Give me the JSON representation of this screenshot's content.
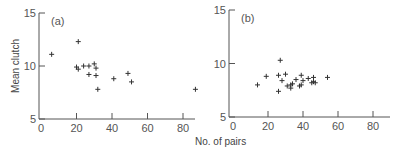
{
  "chart_data": [
    {
      "type": "scatter",
      "panel_label": "(a)",
      "xlabel": "No. of pairs",
      "ylabel": "Mean clutch",
      "xlim": [
        0,
        90
      ],
      "ylim": [
        5,
        15
      ],
      "x_ticks": [
        0,
        20,
        40,
        60,
        80
      ],
      "y_ticks": [
        5,
        10,
        15
      ],
      "grid": false,
      "marker": "+",
      "points": [
        {
          "x": 6,
          "y": 11.1
        },
        {
          "x": 21,
          "y": 12.3
        },
        {
          "x": 20,
          "y": 9.9
        },
        {
          "x": 21,
          "y": 9.7
        },
        {
          "x": 24,
          "y": 10.0
        },
        {
          "x": 27,
          "y": 10.0
        },
        {
          "x": 30,
          "y": 10.2
        },
        {
          "x": 31,
          "y": 9.8
        },
        {
          "x": 27,
          "y": 9.2
        },
        {
          "x": 31,
          "y": 9.1
        },
        {
          "x": 32,
          "y": 7.8
        },
        {
          "x": 41,
          "y": 8.8
        },
        {
          "x": 49,
          "y": 9.3
        },
        {
          "x": 51,
          "y": 8.5
        },
        {
          "x": 87,
          "y": 7.8
        }
      ]
    },
    {
      "type": "scatter",
      "panel_label": "(b)",
      "xlabel": "No. of pairs",
      "ylabel": "",
      "xlim": [
        0,
        90
      ],
      "ylim": [
        5,
        15
      ],
      "x_ticks": [
        0,
        20,
        40,
        60,
        80
      ],
      "y_ticks": [
        5,
        10,
        15
      ],
      "grid": false,
      "marker": "+",
      "points": [
        {
          "x": 14,
          "y": 8.0
        },
        {
          "x": 19,
          "y": 8.8
        },
        {
          "x": 26,
          "y": 8.9
        },
        {
          "x": 27,
          "y": 10.3
        },
        {
          "x": 28,
          "y": 8.4
        },
        {
          "x": 30,
          "y": 9.0
        },
        {
          "x": 26,
          "y": 7.4
        },
        {
          "x": 31,
          "y": 7.9
        },
        {
          "x": 33,
          "y": 8.0
        },
        {
          "x": 33,
          "y": 7.7
        },
        {
          "x": 34,
          "y": 8.1
        },
        {
          "x": 36,
          "y": 8.5
        },
        {
          "x": 38,
          "y": 7.9
        },
        {
          "x": 39,
          "y": 8.0
        },
        {
          "x": 39,
          "y": 8.9
        },
        {
          "x": 40,
          "y": 8.4
        },
        {
          "x": 43,
          "y": 8.6
        },
        {
          "x": 45,
          "y": 8.2
        },
        {
          "x": 46,
          "y": 8.7
        },
        {
          "x": 46,
          "y": 8.3
        },
        {
          "x": 47,
          "y": 8.2
        },
        {
          "x": 54,
          "y": 8.7
        }
      ]
    }
  ],
  "shared": {
    "xlabel": "No. of pairs",
    "ylabel": "Mean clutch"
  }
}
